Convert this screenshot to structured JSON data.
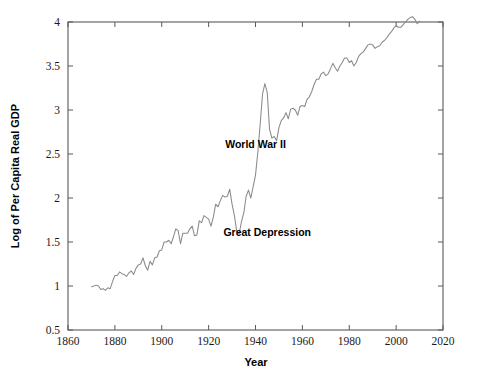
{
  "chart_data": {
    "type": "line",
    "title": "",
    "xlabel": "Year",
    "ylabel": "Log of Per Capita Real GDP",
    "xlim": [
      1860,
      2020
    ],
    "ylim": [
      0.5,
      4
    ],
    "xticks": [
      1860,
      1880,
      1900,
      1920,
      1940,
      1960,
      1980,
      2000,
      2020
    ],
    "yticks": [
      0.5,
      1,
      1.5,
      2,
      2.5,
      3,
      3.5,
      4
    ],
    "xtick_labels": [
      "1860",
      "1880",
      "1900",
      "1920",
      "1940",
      "1960",
      "1980",
      "2000",
      "2020"
    ],
    "ytick_labels": [
      "0.5",
      "1",
      "1.5",
      "2",
      "2.5",
      "3",
      "3.5",
      "4"
    ],
    "grid": false,
    "legend": null,
    "line_color": "#8a8a8a",
    "annotations": [
      {
        "text": "World War II",
        "x": 1940,
        "y": 2.57
      },
      {
        "text": "Great Depression",
        "x": 1945,
        "y": 1.57
      }
    ],
    "series": [
      {
        "name": "Log of Per Capita Real GDP",
        "x": [
          1870,
          1871,
          1872,
          1873,
          1874,
          1875,
          1876,
          1877,
          1878,
          1879,
          1880,
          1881,
          1882,
          1883,
          1884,
          1885,
          1886,
          1887,
          1888,
          1889,
          1890,
          1891,
          1892,
          1893,
          1894,
          1895,
          1896,
          1897,
          1898,
          1899,
          1900,
          1901,
          1902,
          1903,
          1904,
          1905,
          1906,
          1907,
          1908,
          1909,
          1910,
          1911,
          1912,
          1913,
          1914,
          1915,
          1916,
          1917,
          1918,
          1919,
          1920,
          1921,
          1922,
          1923,
          1924,
          1925,
          1926,
          1927,
          1928,
          1929,
          1930,
          1931,
          1932,
          1933,
          1934,
          1935,
          1936,
          1937,
          1938,
          1939,
          1940,
          1941,
          1942,
          1943,
          1944,
          1945,
          1946,
          1947,
          1948,
          1949,
          1950,
          1951,
          1952,
          1953,
          1954,
          1955,
          1956,
          1957,
          1958,
          1959,
          1960,
          1961,
          1962,
          1963,
          1964,
          1965,
          1966,
          1967,
          1968,
          1969,
          1970,
          1971,
          1972,
          1973,
          1974,
          1975,
          1976,
          1977,
          1978,
          1979,
          1980,
          1981,
          1982,
          1983,
          1984,
          1985,
          1986,
          1987,
          1988,
          1989,
          1990,
          1991,
          1992,
          1993,
          1994,
          1995,
          1996,
          1997,
          1998,
          1999,
          2000,
          2001,
          2002,
          2003,
          2004,
          2005,
          2006,
          2007,
          2008,
          2009,
          2010
        ],
        "values": [
          0.99,
          1.0,
          1.01,
          1.0,
          0.96,
          0.97,
          0.95,
          0.98,
          0.97,
          1.05,
          1.12,
          1.12,
          1.16,
          1.14,
          1.13,
          1.11,
          1.15,
          1.17,
          1.13,
          1.2,
          1.24,
          1.25,
          1.32,
          1.23,
          1.18,
          1.28,
          1.24,
          1.32,
          1.33,
          1.4,
          1.41,
          1.5,
          1.5,
          1.52,
          1.48,
          1.56,
          1.65,
          1.63,
          1.48,
          1.6,
          1.6,
          1.6,
          1.65,
          1.68,
          1.57,
          1.58,
          1.74,
          1.72,
          1.8,
          1.78,
          1.76,
          1.68,
          1.78,
          1.93,
          1.9,
          1.97,
          2.03,
          2.01,
          2.02,
          2.1,
          1.93,
          1.8,
          1.62,
          1.59,
          1.73,
          1.83,
          2.02,
          2.09,
          2.0,
          2.13,
          2.26,
          2.52,
          2.84,
          3.18,
          3.3,
          3.2,
          2.78,
          2.68,
          2.7,
          2.65,
          2.8,
          2.88,
          2.91,
          2.97,
          2.9,
          3.01,
          3.02,
          3.0,
          2.94,
          3.04,
          3.05,
          3.04,
          3.12,
          3.15,
          3.21,
          3.29,
          3.35,
          3.35,
          3.41,
          3.43,
          3.39,
          3.41,
          3.47,
          3.53,
          3.48,
          3.44,
          3.5,
          3.54,
          3.59,
          3.59,
          3.54,
          3.56,
          3.5,
          3.54,
          3.61,
          3.64,
          3.66,
          3.7,
          3.74,
          3.75,
          3.74,
          3.7,
          3.72,
          3.73,
          3.77,
          3.79,
          3.82,
          3.86,
          3.89,
          3.93,
          3.96,
          3.94,
          3.94,
          3.97,
          4.0,
          4.03,
          4.05,
          4.06,
          4.03,
          3.98,
          4.01
        ]
      }
    ]
  }
}
